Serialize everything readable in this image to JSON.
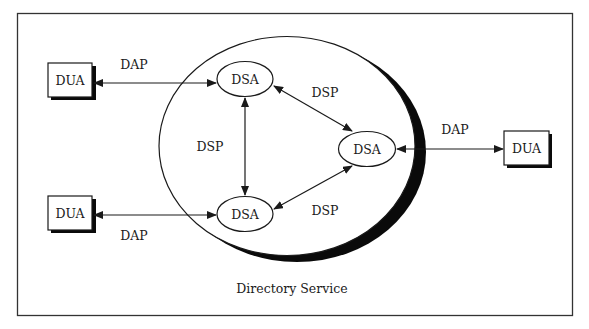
{
  "diagram": {
    "title": "Directory Service",
    "caption": "Directory Service",
    "colors": {
      "line": "#1a1a1a",
      "shadow": "#0a0a0a",
      "frame": "#333333",
      "background": "#ffffff"
    },
    "nodes": {
      "dua_top_left": {
        "label": "DUA",
        "type": "user-agent"
      },
      "dua_bottom_left": {
        "label": "DUA",
        "type": "user-agent"
      },
      "dua_right": {
        "label": "DUA",
        "type": "user-agent"
      },
      "dsa_top": {
        "label": "DSA",
        "type": "system-agent"
      },
      "dsa_bottom": {
        "label": "DSA",
        "type": "system-agent"
      },
      "dsa_right": {
        "label": "DSA",
        "type": "system-agent"
      }
    },
    "edges": {
      "dap_top_left": {
        "label": "DAP",
        "from": "DUA",
        "to": "DSA",
        "bidirectional": true
      },
      "dap_bottom_left": {
        "label": "DAP",
        "from": "DUA",
        "to": "DSA",
        "bidirectional": true
      },
      "dap_right": {
        "label": "DAP",
        "from": "DSA",
        "to": "DUA",
        "bidirectional": true
      },
      "dsp_vertical": {
        "label": "DSP",
        "from": "DSA",
        "to": "DSA",
        "bidirectional": true
      },
      "dsp_upper_diag": {
        "label": "DSP",
        "from": "DSA",
        "to": "DSA",
        "bidirectional": true
      },
      "dsp_lower_diag": {
        "label": "DSP",
        "from": "DSA",
        "to": "DSA",
        "bidirectional": true
      }
    }
  }
}
